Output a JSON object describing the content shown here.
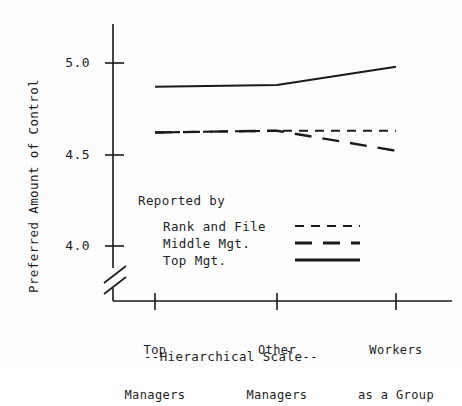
{
  "chart_data": {
    "type": "line",
    "title": "",
    "subtitle": "",
    "xlabel": "--Hierarchical Scale--",
    "ylabel": "Preferred Amount of Control",
    "categories": [
      "Top Managers",
      "Other Managers",
      "Workers as a Group"
    ],
    "category_lines": [
      [
        "Top",
        "Managers"
      ],
      [
        "Other",
        "Managers"
      ],
      [
        "Workers",
        "as a Group"
      ]
    ],
    "yticks": [
      "5.0",
      "4.5",
      "4.0"
    ],
    "ytick_values": [
      5.0,
      4.5,
      4.0
    ],
    "ylim": [
      3.92,
      5.12
    ],
    "y_axis_broken": true,
    "grid": false,
    "legend_position": "inside-lower-left",
    "legend_title": "Reported by",
    "series": [
      {
        "name": "Rank and File",
        "style": "short-dash",
        "values": [
          4.62,
          4.63,
          4.63
        ]
      },
      {
        "name": "Middle Mgt.",
        "style": "long-dash",
        "values": [
          4.62,
          4.63,
          4.52
        ]
      },
      {
        "name": "Top Mgt.",
        "style": "solid",
        "values": [
          4.87,
          4.88,
          4.98
        ]
      }
    ],
    "line_color": "#1a1a1a",
    "background_color": "#fdfdfd"
  },
  "axis": {
    "y_label": "Preferred Amount of Control",
    "x_label": "--Hierarchical Scale--",
    "tick_0": "5.0",
    "tick_1": "4.5",
    "tick_2": "4.0"
  },
  "xcats": {
    "cat0_line0": "Top",
    "cat0_line1": "Managers",
    "cat1_line0": "Other",
    "cat1_line1": "Managers",
    "cat2_line0": "Workers",
    "cat2_line1": "as a Group"
  },
  "legend": {
    "title": "Reported by",
    "item0": "Rank and File",
    "item1": "Middle Mgt.",
    "item2": "Top Mgt."
  }
}
